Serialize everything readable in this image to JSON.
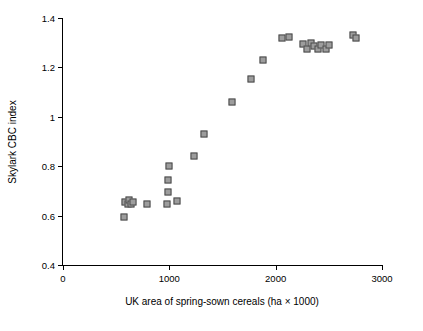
{
  "chart_data": {
    "type": "scatter",
    "title": "",
    "xlabel": "UK area of spring-sown cereals (ha × 1000)",
    "ylabel": "Skylark CBC index",
    "xlim": [
      0,
      3000
    ],
    "ylim": [
      0.4,
      1.4
    ],
    "xticks": [
      0,
      1000,
      2000,
      3000
    ],
    "xtick_labels": [
      "0",
      "1000",
      "2000",
      "3000"
    ],
    "yticks": [
      0.4,
      0.6,
      0.8,
      1.0,
      1.2,
      1.4
    ],
    "ytick_labels": [
      "0.4",
      "0.6",
      "0.8",
      "1",
      "1.2",
      "1.4"
    ],
    "grid": false,
    "legend": false,
    "marker": {
      "shape": "square",
      "fill": "#9d9d9d",
      "edge": "#4a4a4a",
      "size_px": 7
    },
    "series": [
      {
        "name": "Skylark CBC index vs spring cereal area",
        "points": [
          {
            "x": 575,
            "y": 0.595
          },
          {
            "x": 580,
            "y": 0.655
          },
          {
            "x": 610,
            "y": 0.645
          },
          {
            "x": 625,
            "y": 0.665
          },
          {
            "x": 640,
            "y": 0.645
          },
          {
            "x": 660,
            "y": 0.655
          },
          {
            "x": 790,
            "y": 0.645
          },
          {
            "x": 975,
            "y": 0.645
          },
          {
            "x": 985,
            "y": 0.695
          },
          {
            "x": 990,
            "y": 0.745
          },
          {
            "x": 1000,
            "y": 0.8
          },
          {
            "x": 1070,
            "y": 0.66
          },
          {
            "x": 1235,
            "y": 0.84
          },
          {
            "x": 1330,
            "y": 0.93
          },
          {
            "x": 1590,
            "y": 1.06
          },
          {
            "x": 1770,
            "y": 1.155
          },
          {
            "x": 1880,
            "y": 1.23
          },
          {
            "x": 2060,
            "y": 1.32
          },
          {
            "x": 2130,
            "y": 1.325
          },
          {
            "x": 2255,
            "y": 1.295
          },
          {
            "x": 2295,
            "y": 1.275
          },
          {
            "x": 2330,
            "y": 1.3
          },
          {
            "x": 2360,
            "y": 1.285
          },
          {
            "x": 2395,
            "y": 1.275
          },
          {
            "x": 2425,
            "y": 1.29
          },
          {
            "x": 2470,
            "y": 1.275
          },
          {
            "x": 2505,
            "y": 1.29
          },
          {
            "x": 2725,
            "y": 1.33
          },
          {
            "x": 2760,
            "y": 1.32
          }
        ]
      }
    ]
  }
}
